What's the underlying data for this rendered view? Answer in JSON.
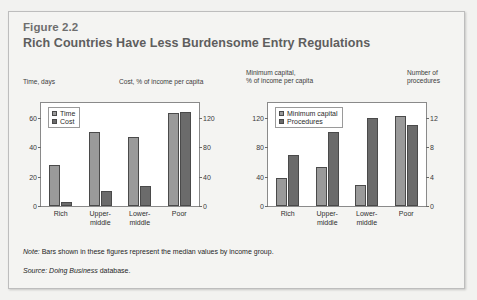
{
  "figure": {
    "number": "Figure 2.2",
    "title": "Rich Countries Have Less Burdensome Entry Regulations",
    "note_label": "Note:",
    "note_text": " Bars shown in these figures represent the median values by income group.",
    "source_label": "Source:",
    "source_italic": " Doing Business",
    "source_text": " database."
  },
  "captions": {
    "time": "Time, days",
    "cost": "Cost, % of income per capita",
    "minimum_capital": "Minimum capital,\n% of income per capita",
    "procedures": "Number of\nprocedures"
  },
  "colors": {
    "light_bar": "#9a9a9a",
    "dark_bar": "#6b6b6b",
    "panel_bg": "#f4f4f2",
    "plot_bg": "#ffffff",
    "border": "#8a8a8a",
    "title_text": "#5e5e5e"
  },
  "chart_data": [
    {
      "type": "bar",
      "id": "left-chart",
      "title": "",
      "categories": [
        "Rich",
        "Upper-\nmiddle",
        "Lower-\nmiddle",
        "Poor"
      ],
      "legend": [
        "Time",
        "Cost"
      ],
      "legend_position": "top-left",
      "grid": false,
      "left_axis": {
        "label": "Time, days",
        "ticks": [
          "0",
          "20",
          "40",
          "60"
        ],
        "values": [
          0,
          20,
          40,
          60
        ],
        "ylim": [
          0,
          70
        ]
      },
      "right_axis": {
        "label": "Cost, % of income per capita",
        "ticks": [
          "0",
          "40",
          "80",
          "120"
        ],
        "values": [
          0,
          40,
          80,
          120
        ],
        "ylim": [
          0,
          140
        ]
      },
      "series": [
        {
          "name": "Time",
          "axis": "left",
          "values": [
            28,
            50,
            47,
            63
          ]
        },
        {
          "name": "Cost",
          "axis": "right",
          "values": [
            6,
            21,
            27,
            128
          ]
        }
      ]
    },
    {
      "type": "bar",
      "id": "right-chart",
      "title": "",
      "categories": [
        "Rich",
        "Upper-\nmiddle",
        "Lower-\nmiddle",
        "Poor"
      ],
      "legend": [
        "Minimum capital",
        "Procedures"
      ],
      "legend_position": "top-left",
      "grid": false,
      "left_axis": {
        "label": "Minimum capital, % of income per capita",
        "ticks": [
          "0",
          "40",
          "80",
          "120"
        ],
        "values": [
          0,
          40,
          80,
          120
        ],
        "ylim": [
          0,
          140
        ]
      },
      "right_axis": {
        "label": "Number of procedures",
        "ticks": [
          "0",
          "4",
          "8",
          "12"
        ],
        "values": [
          0,
          4,
          8,
          12
        ],
        "ylim": [
          0,
          14
        ]
      },
      "series": [
        {
          "name": "Minimum capital",
          "axis": "left",
          "values": [
            38,
            53,
            29,
            122
          ]
        },
        {
          "name": "Procedures",
          "axis": "right",
          "values": [
            7,
            10,
            12,
            11
          ]
        }
      ]
    }
  ]
}
